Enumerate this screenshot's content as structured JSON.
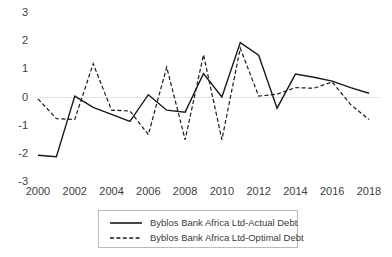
{
  "chart_data": {
    "type": "line",
    "title": "",
    "xlabel": "",
    "ylabel": "",
    "x": [
      2000,
      2001,
      2002,
      2003,
      2004,
      2005,
      2006,
      2007,
      2008,
      2009,
      2010,
      2011,
      2012,
      2013,
      2014,
      2015,
      2016,
      2017,
      2018
    ],
    "xlim": [
      2000,
      2018
    ],
    "ylim": [
      -3,
      3
    ],
    "ytick_labels": [
      "3",
      "2",
      "1",
      "0",
      "-1",
      "-2",
      "-3"
    ],
    "ytick_values": [
      3,
      2,
      1,
      0,
      -1,
      -2,
      -3
    ],
    "xtick_labels": [
      "2000",
      "2002",
      "2004",
      "2006",
      "2008",
      "2010",
      "2012",
      "2014",
      "2016",
      "2018"
    ],
    "xtick_values": [
      2000,
      2002,
      2004,
      2006,
      2008,
      2010,
      2012,
      2014,
      2016,
      2018
    ],
    "grid": false,
    "zero_line": true,
    "legend_position": "bottom-center",
    "series": [
      {
        "name": "Byblos Bank Africa Ltd-Actual Debt",
        "style": "solid",
        "color": "#1a1a1a",
        "values": [
          -2.05,
          -2.1,
          0.05,
          -0.35,
          -0.6,
          -0.85,
          0.1,
          -0.45,
          -0.52,
          0.85,
          0.02,
          1.95,
          1.5,
          -0.38,
          0.83,
          0.72,
          0.58,
          0.35,
          0.15
        ]
      },
      {
        "name": "Byblos Bank Africa Ltd-Optimal Debt",
        "style": "dashed",
        "color": "#1a1a1a",
        "values": [
          -0.05,
          -0.75,
          -0.78,
          1.2,
          -0.45,
          -0.48,
          -1.32,
          1.08,
          -1.5,
          1.52,
          -1.5,
          1.75,
          0.05,
          0.12,
          0.35,
          0.33,
          0.55,
          -0.25,
          -0.78
        ]
      }
    ]
  },
  "legend": {
    "items": [
      {
        "label": "Byblos Bank Africa Ltd-Actual Debt",
        "style": "solid"
      },
      {
        "label": "Byblos Bank Africa Ltd-Optimal Debt",
        "style": "dashed"
      }
    ]
  }
}
